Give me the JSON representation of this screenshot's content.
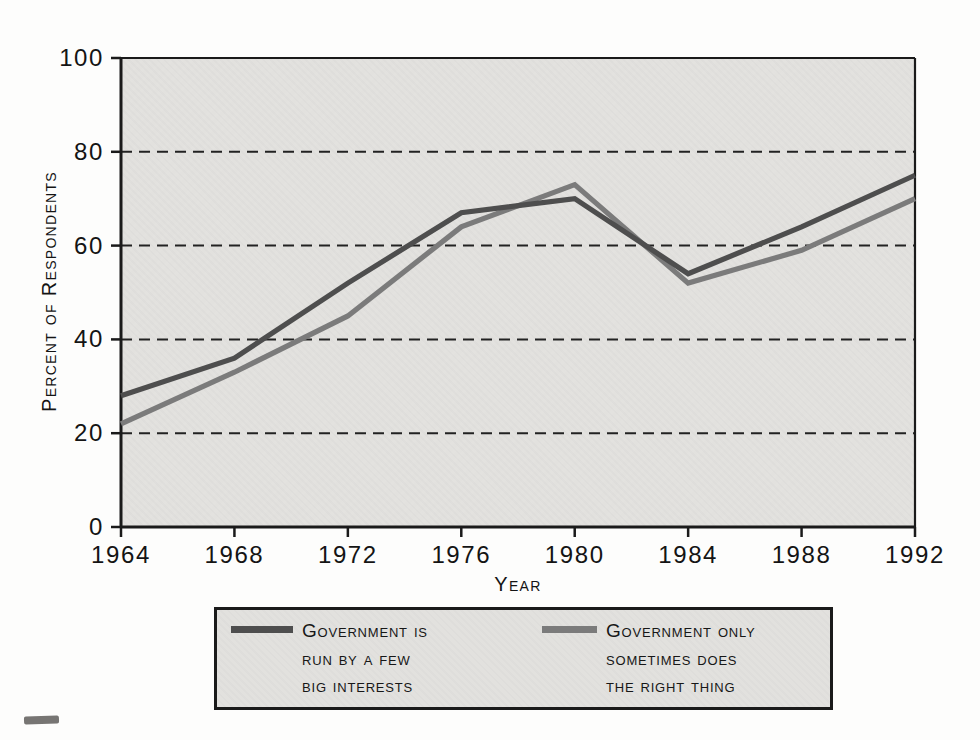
{
  "chart_data": {
    "type": "line",
    "x": [
      1964,
      1968,
      1972,
      1976,
      1980,
      1984,
      1988,
      1992
    ],
    "series": [
      {
        "name": "Government is run by a few big interests",
        "values": [
          28,
          36,
          52,
          67,
          70,
          54,
          64,
          75
        ],
        "color": "#4e4e4e",
        "line_width": 5.2
      },
      {
        "name": "Government only sometimes does the right thing",
        "values": [
          22,
          33,
          45,
          64,
          73,
          52,
          59,
          70
        ],
        "color": "#7b7b7b",
        "line_width": 5.2
      }
    ],
    "xlabel": "Year",
    "ylabel": "Percent of Respondents",
    "xlim": [
      1964,
      1992
    ],
    "ylim": [
      0,
      100
    ],
    "x_ticks": [
      1964,
      1968,
      1972,
      1976,
      1980,
      1984,
      1988,
      1992
    ],
    "y_ticks": [
      0,
      20,
      40,
      60,
      80,
      100
    ],
    "gridlines": [
      20,
      40,
      60,
      80
    ],
    "grid_style": "dashed",
    "legend_position": "bottom"
  },
  "legend": {
    "entries": [
      {
        "label": "Government is\nrun by a few\nbig interests",
        "color": "#4e4e4e"
      },
      {
        "label": "Government only\nsometimes does\nthe right thing",
        "color": "#7b7b7b"
      }
    ]
  },
  "colors": {
    "plot_background": "#e2e1de",
    "grid": "#222222",
    "axis": "#1a1a1a",
    "page_background": "#fdfdfc"
  }
}
